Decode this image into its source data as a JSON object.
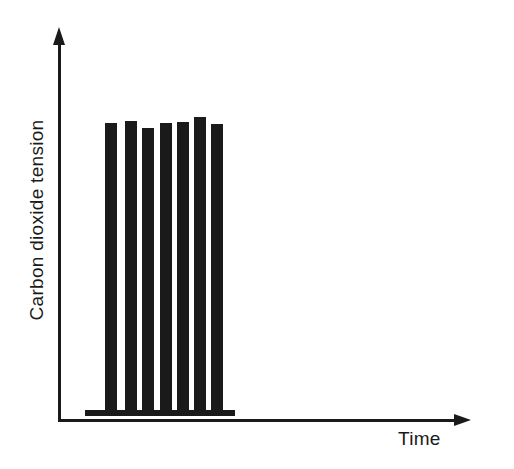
{
  "figure": {
    "background": "#ffffff",
    "ink_color": "#1a1a1a"
  },
  "chart_data": {
    "type": "bar",
    "title": "",
    "xlabel": "Time",
    "ylabel": "Carbon dioxide tension",
    "categories": [
      "1",
      "2",
      "3",
      "4",
      "5",
      "6",
      "7"
    ],
    "values": [
      287,
      289,
      282,
      287,
      288,
      293,
      286
    ],
    "value_units": "arbitrary (no numeric tick labels shown)",
    "ylim": [
      0,
      382
    ],
    "axis_tick_labels": "none",
    "grid": false,
    "legend": false,
    "baseline_segment": {
      "present": true,
      "value": 0
    }
  }
}
